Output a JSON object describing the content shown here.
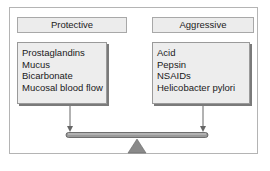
{
  "diagram": {
    "left": {
      "title": "Protective",
      "items": [
        "Prostaglandins",
        "Mucus",
        "Bicarbonate",
        "Mucosal blood flow"
      ]
    },
    "right": {
      "title": "Aggressive",
      "items": [
        "Acid",
        "Pepsin",
        "NSAIDs",
        "Helicobacter pylori"
      ]
    },
    "colors": {
      "box_fill": "#ededed",
      "border": "#9a9a9a",
      "arrow": "#666666",
      "fulcrum": "#8a8a8a"
    }
  }
}
